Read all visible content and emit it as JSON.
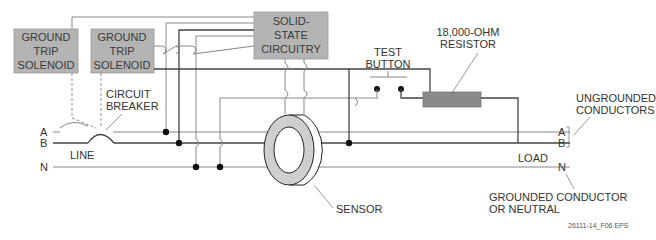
{
  "diagram": {
    "figure_id": "26111-14_F06.EPS",
    "components": {
      "solenoid_1": {
        "line1": "GROUND",
        "line2": "TRIP",
        "line3": "SOLENOID"
      },
      "solenoid_2": {
        "line1": "GROUND",
        "line2": "TRIP",
        "line3": "SOLENOID"
      },
      "solid_state": {
        "line1": "SOLID-",
        "line2": "STATE",
        "line3": "CIRCUITRY"
      },
      "test_button": {
        "line1": "TEST",
        "line2": "BUTTON"
      },
      "resistor": {
        "line1": "18,000-OHM",
        "line2": "RESISTOR"
      },
      "circuit_breaker": {
        "line1": "CIRCUIT",
        "line2": "BREAKER"
      },
      "sensor": {
        "label": "SENSOR"
      }
    },
    "conductors": {
      "line_side": {
        "label": "LINE",
        "a": "A",
        "b": "B",
        "n": "N"
      },
      "load_side": {
        "label": "LOAD",
        "a": "A",
        "b": "B",
        "n": "N"
      },
      "ungrounded": {
        "line1": "UNGROUNDED",
        "line2": "CONDUCTORS"
      },
      "grounded": {
        "line1": "GROUNDED CONDUCTOR",
        "line2": "OR NEUTRAL"
      }
    },
    "colors": {
      "box_fill": "#b4b4b4",
      "resistor_fill": "#8a8a8a",
      "wire": "#888888",
      "wire_dark": "#444444"
    }
  }
}
